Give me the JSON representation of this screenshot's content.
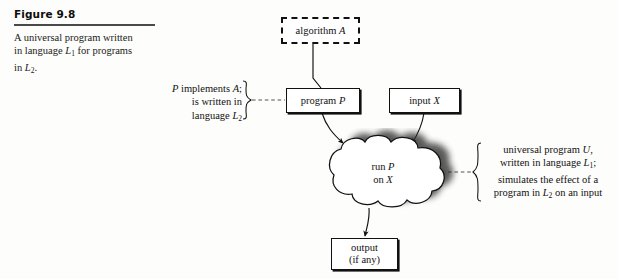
{
  "figure": {
    "number": "Figure 9.8",
    "caption_line1": "A universal program written",
    "caption_line2_pre": "in language ",
    "caption_line2_var": "L",
    "caption_line2_sub": "1",
    "caption_line2_post": " for programs",
    "caption_line3_pre": "in ",
    "caption_line3_var": "L",
    "caption_line3_sub": "2",
    "caption_line3_post": "."
  },
  "nodes": {
    "algorithm": {
      "label_text": "algorithm ",
      "label_var": "A",
      "border_style": "dashed"
    },
    "program": {
      "label_text": "program ",
      "label_var": "P",
      "border_style": "solid"
    },
    "input": {
      "label_text": "input ",
      "label_var": "X",
      "border_style": "solid"
    },
    "cloud": {
      "line1_text": "run ",
      "line1_var": "P",
      "line2_text": "on ",
      "line2_var": "X"
    },
    "output": {
      "line1": "output",
      "line2": "(if any)",
      "border_style": "solid"
    }
  },
  "annotations": {
    "left": {
      "line1_pre": "",
      "line1_var": "P",
      "line1_mid": " implements ",
      "line1_var2": "A",
      "line1_post": ";",
      "line2": "is written in",
      "line3_pre": "language ",
      "line3_var": "L",
      "line3_sub": "2"
    },
    "right": {
      "line1_pre": "universal program ",
      "line1_var": "U",
      "line1_post": ",",
      "line2_pre": "written in language ",
      "line2_var": "L",
      "line2_sub": "1",
      "line2_post": ";",
      "line3": "simulates the effect of a",
      "line4_pre": "program in ",
      "line4_var": "L",
      "line4_sub": "2",
      "line4_post": " on an input"
    }
  },
  "colors": {
    "ink": "#111111",
    "rule": "#4a4a4a",
    "page": "#fdfdfb",
    "shadow": "#3a3a3a"
  }
}
